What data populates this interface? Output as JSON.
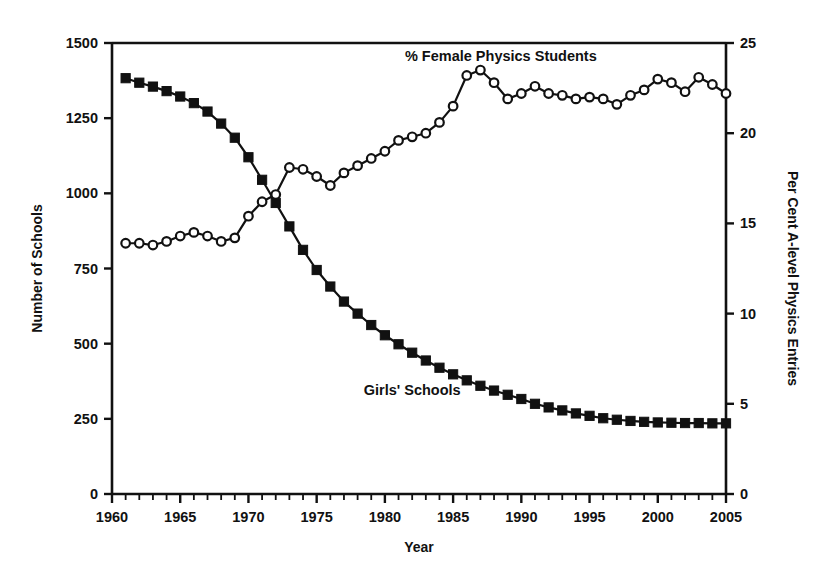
{
  "chart_data": {
    "type": "line",
    "title": "",
    "xlabel": "Year",
    "ylabel": "Number of Schools",
    "y2label": "Per Cent A-level Physics Entries",
    "xlim": [
      1960,
      2005
    ],
    "ylim": [
      0,
      1500
    ],
    "y2lim": [
      0,
      25
    ],
    "xticks": [
      1960,
      1965,
      1970,
      1975,
      1980,
      1985,
      1990,
      1995,
      2000,
      2005
    ],
    "xticklabels": [
      "1960",
      "1965",
      "1970",
      "1975",
      "1980",
      "1985",
      "1990",
      "1995",
      "2000",
      "2005"
    ],
    "xminorticks": 1,
    "yticks": [
      0,
      250,
      500,
      750,
      1000,
      1250,
      1500
    ],
    "yticklabels": [
      "0",
      "250",
      "500",
      "750",
      "1000",
      "1250",
      "1500"
    ],
    "y2ticks": [
      0,
      5,
      10,
      15,
      20,
      25
    ],
    "y2ticklabels": [
      "0",
      "5",
      "10",
      "15",
      "20",
      "25"
    ],
    "grid": false,
    "legend_position": "inline-annotations",
    "x": [
      1961,
      1962,
      1963,
      1964,
      1965,
      1966,
      1967,
      1968,
      1969,
      1970,
      1971,
      1972,
      1973,
      1974,
      1975,
      1976,
      1977,
      1978,
      1979,
      1980,
      1981,
      1982,
      1983,
      1984,
      1985,
      1986,
      1987,
      1988,
      1989,
      1990,
      1991,
      1992,
      1993,
      1994,
      1995,
      1996,
      1997,
      1998,
      1999,
      2000,
      2001,
      2002,
      2003,
      2004,
      2005
    ],
    "series": [
      {
        "name": "Girls' Schools",
        "axis": "left",
        "marker": "filled-square",
        "label": "Girls' Schools",
        "label_x": 1982.0,
        "label_y": 330,
        "values": [
          1383,
          1368,
          1355,
          1340,
          1322,
          1300,
          1272,
          1232,
          1185,
          1120,
          1045,
          968,
          890,
          812,
          745,
          690,
          640,
          600,
          562,
          528,
          498,
          470,
          444,
          420,
          398,
          378,
          360,
          344,
          330,
          316,
          300,
          288,
          278,
          268,
          260,
          252,
          247,
          243,
          240,
          238,
          237,
          236,
          236,
          235,
          235
        ]
      },
      {
        "name": "% Female Physics Students",
        "axis": "right",
        "marker": "open-circle",
        "label": "% Female Physics Students",
        "label_x": 1988.5,
        "label_y": 24.0,
        "values": [
          13.9,
          13.9,
          13.8,
          14.0,
          14.3,
          14.5,
          14.3,
          14.0,
          14.2,
          15.4,
          16.2,
          16.6,
          18.1,
          18.0,
          17.6,
          17.1,
          17.8,
          18.2,
          18.6,
          19.0,
          19.6,
          19.8,
          20.0,
          20.6,
          21.5,
          23.2,
          23.5,
          22.8,
          21.9,
          22.2,
          22.6,
          22.2,
          22.1,
          21.9,
          22.0,
          21.9,
          21.6,
          22.1,
          22.4,
          23.0,
          22.8,
          22.3,
          23.1,
          22.7,
          22.2
        ]
      }
    ]
  }
}
